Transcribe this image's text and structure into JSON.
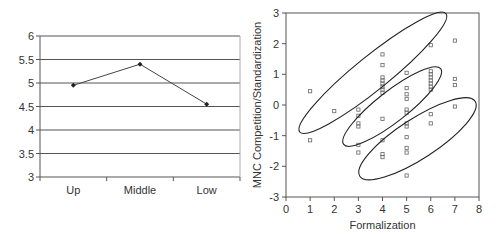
{
  "chart_data": [
    {
      "type": "line",
      "title": "",
      "xlabel": "",
      "ylabel": "",
      "categories": [
        "Up",
        "Middle",
        "Low"
      ],
      "values": [
        4.95,
        5.4,
        4.55
      ],
      "ylim": [
        3,
        6
      ],
      "yticks": [
        "3",
        "3.5",
        "4",
        "4.5",
        "5",
        "5.5",
        "6"
      ],
      "grid": true,
      "legend": null
    },
    {
      "type": "scatter",
      "title": "",
      "xlabel": "Formalization",
      "ylabel": "MNC Competition/Standardization",
      "xlim": [
        0,
        8
      ],
      "ylim": [
        -3,
        3
      ],
      "xticks": [
        "0",
        "1",
        "2",
        "3",
        "4",
        "5",
        "6",
        "7",
        "8"
      ],
      "yticks": [
        "-3",
        "-2",
        "-1",
        "0",
        "1",
        "2",
        "3"
      ],
      "grid": false,
      "points": [
        [
          1,
          0.45
        ],
        [
          1,
          -1.15
        ],
        [
          2,
          -0.2
        ],
        [
          3,
          -0.15
        ],
        [
          3,
          -0.35
        ],
        [
          3,
          -0.6
        ],
        [
          3,
          -0.7
        ],
        [
          3,
          -1.3
        ],
        [
          3,
          -1.55
        ],
        [
          4,
          1.65
        ],
        [
          4,
          1.3
        ],
        [
          4,
          0.9
        ],
        [
          4,
          0.8
        ],
        [
          4,
          0.7
        ],
        [
          4,
          0.6
        ],
        [
          4,
          0.5
        ],
        [
          4,
          0.4
        ],
        [
          4,
          -0.45
        ],
        [
          4,
          -1.15
        ],
        [
          4,
          -1.6
        ],
        [
          4,
          -1.7
        ],
        [
          5,
          1.05
        ],
        [
          5,
          0.55
        ],
        [
          5,
          0.35
        ],
        [
          5,
          0.2
        ],
        [
          5,
          -0.15
        ],
        [
          5,
          -0.25
        ],
        [
          5,
          -0.6
        ],
        [
          5,
          -0.7
        ],
        [
          5,
          -1.05
        ],
        [
          5,
          -1.4
        ],
        [
          5,
          -1.55
        ],
        [
          5,
          -2.3
        ],
        [
          6,
          1.95
        ],
        [
          6,
          1.1
        ],
        [
          6,
          1.0
        ],
        [
          6,
          0.9
        ],
        [
          6,
          0.8
        ],
        [
          6,
          0.7
        ],
        [
          6,
          0.6
        ],
        [
          6,
          0.5
        ],
        [
          6,
          -0.3
        ],
        [
          6,
          -0.6
        ],
        [
          7,
          2.1
        ],
        [
          7,
          0.85
        ],
        [
          7,
          0.65
        ],
        [
          7,
          -0.05
        ]
      ],
      "ellipses": [
        {
          "cx": 3.6,
          "cy": 1.05,
          "rx": 3.9,
          "ry": 0.55,
          "angle_deg": -39
        },
        {
          "cx": 4.4,
          "cy": -0.05,
          "rx": 2.55,
          "ry": 0.5,
          "angle_deg": -38
        },
        {
          "cx": 5.45,
          "cy": -1.1,
          "rx": 2.85,
          "ry": 0.65,
          "angle_deg": -33
        }
      ]
    }
  ]
}
